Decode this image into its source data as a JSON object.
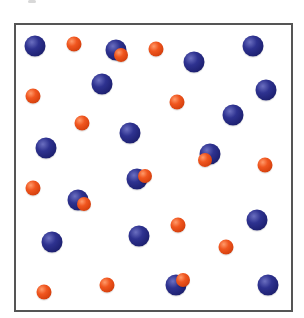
{
  "diagram": {
    "colors": {
      "blue": "#2e3290",
      "red": "#f0561f",
      "border": "#555555",
      "background": "#ffffff"
    },
    "counts": {
      "blue": 17,
      "red_free": 11,
      "bound_pairs": 5
    },
    "blue_particles": [
      {
        "x": 35,
        "y": 46
      },
      {
        "x": 102,
        "y": 84
      },
      {
        "x": 116,
        "y": 50
      },
      {
        "x": 194,
        "y": 62
      },
      {
        "x": 253,
        "y": 46
      },
      {
        "x": 266,
        "y": 90
      },
      {
        "x": 233,
        "y": 115
      },
      {
        "x": 130,
        "y": 133
      },
      {
        "x": 46,
        "y": 148
      },
      {
        "x": 210,
        "y": 154
      },
      {
        "x": 137,
        "y": 179
      },
      {
        "x": 78,
        "y": 200
      },
      {
        "x": 257,
        "y": 220
      },
      {
        "x": 52,
        "y": 242
      },
      {
        "x": 139,
        "y": 236
      },
      {
        "x": 176,
        "y": 285
      },
      {
        "x": 268,
        "y": 285
      }
    ],
    "red_particles": [
      {
        "x": 74,
        "y": 44
      },
      {
        "x": 156,
        "y": 49
      },
      {
        "x": 33,
        "y": 96
      },
      {
        "x": 177,
        "y": 102
      },
      {
        "x": 82,
        "y": 123
      },
      {
        "x": 265,
        "y": 165
      },
      {
        "x": 33,
        "y": 188
      },
      {
        "x": 178,
        "y": 225
      },
      {
        "x": 226,
        "y": 247
      },
      {
        "x": 44,
        "y": 292
      },
      {
        "x": 107,
        "y": 285
      }
    ],
    "bound_red_particles": [
      {
        "x": 121,
        "y": 55
      },
      {
        "x": 205,
        "y": 160
      },
      {
        "x": 145,
        "y": 176
      },
      {
        "x": 84,
        "y": 204
      },
      {
        "x": 183,
        "y": 280
      }
    ]
  }
}
